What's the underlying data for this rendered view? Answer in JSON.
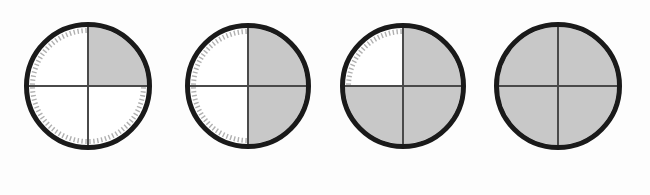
{
  "figure": {
    "type": "quadrant-fill-progression",
    "background_color": "#fdfdfd",
    "width": 650,
    "height": 195,
    "ring_color": "#1a1a1a",
    "ring_width": 5,
    "crosshair_color": "#4a4a4a",
    "crosshair_width": 2,
    "shaded_color": "#c8c8c8",
    "unshaded_color": "#ffffff",
    "tick_color": "#b0b0b0",
    "tick_count_per_quadrant": 22,
    "quadrant_order": [
      "top-right",
      "bottom-right",
      "bottom-left",
      "top-left"
    ]
  },
  "dials": [
    {
      "index": 1,
      "label": "one-quarter-shaded",
      "fraction": "1/4",
      "filled_quadrants": 1,
      "total_quadrants": 4,
      "shaded": [
        "top-right"
      ],
      "unshaded": [
        "bottom-right",
        "bottom-left",
        "top-left"
      ],
      "ticks_on": [
        "bottom-right",
        "bottom-left",
        "top-left"
      ],
      "center_x": 88,
      "center_y": 86,
      "radius": 64
    },
    {
      "index": 2,
      "label": "two-quarters-shaded",
      "fraction": "2/4",
      "filled_quadrants": 2,
      "total_quadrants": 4,
      "shaded": [
        "top-right",
        "bottom-right"
      ],
      "unshaded": [
        "bottom-left",
        "top-left"
      ],
      "ticks_on": [
        "bottom-left",
        "top-left"
      ],
      "center_x": 248,
      "center_y": 86,
      "radius": 63
    },
    {
      "index": 3,
      "label": "three-quarters-shaded",
      "fraction": "3/4",
      "filled_quadrants": 3,
      "total_quadrants": 4,
      "shaded": [
        "top-right",
        "bottom-right",
        "bottom-left"
      ],
      "unshaded": [
        "top-left"
      ],
      "ticks_on": [
        "top-left"
      ],
      "center_x": 403,
      "center_y": 86,
      "radius": 63
    },
    {
      "index": 4,
      "label": "fully-shaded",
      "fraction": "4/4",
      "filled_quadrants": 4,
      "total_quadrants": 4,
      "shaded": [
        "top-right",
        "bottom-right",
        "bottom-left",
        "top-left"
      ],
      "unshaded": [],
      "ticks_on": [],
      "center_x": 558,
      "center_y": 86,
      "radius": 64
    }
  ],
  "chart_data": {
    "type": "pie",
    "title": "",
    "xlabel": "",
    "ylabel": "",
    "legend": [],
    "grid": false,
    "categories": [
      "Dial 1",
      "Dial 2",
      "Dial 3",
      "Dial 4"
    ],
    "values": [
      0.25,
      0.5,
      0.75,
      1.0
    ],
    "value_labels": [
      "1/4",
      "2/4",
      "3/4",
      "4/4"
    ],
    "series": [
      {
        "name": "shaded fraction",
        "values": [
          0.25,
          0.5,
          0.75,
          1.0
        ]
      }
    ],
    "slice_colors": [
      "#c8c8c8",
      "#ffffff"
    ]
  }
}
